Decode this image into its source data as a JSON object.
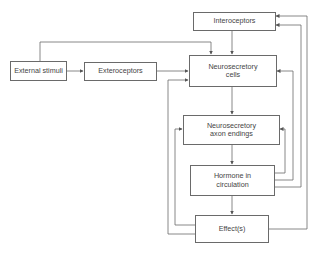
{
  "diagram": {
    "type": "flowchart",
    "nodes": {
      "interoceptors": {
        "label": "Interoceptors"
      },
      "external_stimuli": {
        "label": "External stimuli"
      },
      "exteroceptors": {
        "label": "Exteroceptors"
      },
      "neurosecretory_cells": {
        "line1": "Neurosecretory",
        "line2": "cells"
      },
      "axon_endings": {
        "line1": "Neurosecretory",
        "line2": "axon endings"
      },
      "hormone": {
        "line1": "Hormone in",
        "line2": "circulation"
      },
      "effects": {
        "label": "Effect(s)"
      }
    },
    "edges": [
      {
        "from": "External stimuli",
        "to": "Exteroceptors"
      },
      {
        "from": "External stimuli",
        "to": "Neurosecretory cells"
      },
      {
        "from": "Exteroceptors",
        "to": "Neurosecretory cells"
      },
      {
        "from": "Interoceptors",
        "to": "Neurosecretory cells"
      },
      {
        "from": "Neurosecretory cells",
        "to": "Neurosecretory axon endings"
      },
      {
        "from": "Neurosecretory axon endings",
        "to": "Hormone in circulation"
      },
      {
        "from": "Hormone in circulation",
        "to": "Effect(s)"
      },
      {
        "from": "Hormone in circulation",
        "to": "Neurosecretory axon endings"
      },
      {
        "from": "Hormone in circulation",
        "to": "Neurosecretory cells"
      },
      {
        "from": "Hormone in circulation",
        "to": "Interoceptors"
      },
      {
        "from": "Effect(s)",
        "to": "Interoceptors"
      },
      {
        "from": "Effect(s)",
        "to": "Neurosecretory cells"
      },
      {
        "from": "Effect(s)",
        "to": "Neurosecretory axon endings"
      }
    ],
    "colors": {
      "line": "#6a6a6a",
      "text": "#444444",
      "background": "#ffffff"
    }
  }
}
